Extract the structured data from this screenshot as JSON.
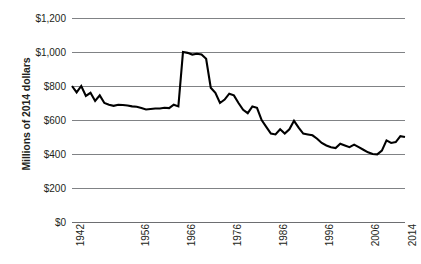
{
  "chart_data": {
    "type": "line",
    "title": "",
    "xlabel": "",
    "ylabel": "Millions of 2014 dollars",
    "ylim": [
      0,
      1200
    ],
    "xlim": [
      1942,
      2014
    ],
    "grid": true,
    "legend": false,
    "y_ticks": [
      0,
      200,
      400,
      600,
      800,
      1000,
      1200
    ],
    "y_tick_labels": [
      "$0",
      "$200",
      "$400",
      "$600",
      "$800",
      "$1,000",
      "$1,200"
    ],
    "x_ticks": [
      1942,
      1956,
      1966,
      1976,
      1986,
      1996,
      2006,
      2014
    ],
    "x_tick_labels": [
      "1942",
      "1956",
      "1966",
      "1976",
      "1986",
      "1996",
      "2006",
      "2014"
    ],
    "line_color": "#000000",
    "grid_color": "#808285",
    "x": [
      1942,
      1943,
      1944,
      1945,
      1946,
      1947,
      1948,
      1949,
      1950,
      1951,
      1952,
      1953,
      1954,
      1955,
      1956,
      1957,
      1958,
      1959,
      1960,
      1961,
      1962,
      1963,
      1964,
      1965,
      1966,
      1967,
      1968,
      1969,
      1970,
      1971,
      1972,
      1973,
      1974,
      1975,
      1976,
      1977,
      1978,
      1979,
      1980,
      1981,
      1982,
      1983,
      1984,
      1985,
      1986,
      1987,
      1988,
      1989,
      1990,
      1991,
      1992,
      1993,
      1994,
      1995,
      1996,
      1997,
      1998,
      1999,
      2000,
      2001,
      2002,
      2003,
      2004,
      2005,
      2006,
      2007,
      2008,
      2009,
      2010,
      2011,
      2012,
      2013,
      2014
    ],
    "values": [
      800,
      762,
      800,
      742,
      760,
      712,
      745,
      700,
      690,
      683,
      690,
      688,
      685,
      680,
      678,
      670,
      662,
      665,
      668,
      668,
      672,
      670,
      690,
      680,
      1000,
      995,
      985,
      990,
      985,
      960,
      790,
      760,
      700,
      720,
      755,
      745,
      700,
      660,
      640,
      680,
      672,
      600,
      560,
      520,
      515,
      545,
      520,
      545,
      595,
      555,
      520,
      515,
      510,
      490,
      465,
      450,
      440,
      435,
      460,
      450,
      440,
      455,
      440,
      425,
      410,
      400,
      398,
      420,
      480,
      465,
      470,
      505,
      500
    ]
  }
}
